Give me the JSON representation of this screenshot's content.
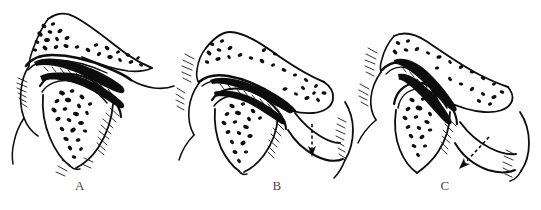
{
  "figure": {
    "type": "anatomical-line-drawing",
    "background_color": "#ffffff",
    "ink_color": "#0d0d0d",
    "label_color": "#4a4a4a",
    "panel_count": 3
  },
  "panels": [
    {
      "id": "A",
      "label": "A",
      "caption_position": "below-center",
      "stage": "closed",
      "has_arrow": false,
      "arrow_style": "",
      "structures": [
        "temporal bone",
        "articular eminence",
        "glenoid fossa",
        "articular disc",
        "mandibular condyle",
        "trabecular bone",
        "external auditory meatus",
        "lateral pterygoid attachment"
      ]
    },
    {
      "id": "B",
      "label": "B",
      "caption_position": "below-center",
      "stage": "partial-opening",
      "has_arrow": true,
      "arrow_style": "dashed-vertical-down",
      "arrow_meaning": "rotation of condyle / downward mandibular movement",
      "structures": [
        "temporal bone",
        "articular eminence",
        "glenoid fossa",
        "articular disc",
        "mandibular condyle",
        "mandibular ramus",
        "mandibular body",
        "trabecular bone",
        "lateral pterygoid attachment"
      ]
    },
    {
      "id": "C",
      "label": "C",
      "caption_position": "below-center",
      "stage": "full-translation",
      "has_arrow": true,
      "arrow_style": "dashed-diagonal-down-left",
      "arrow_meaning": "anterior translation of condyle / full opening",
      "structures": [
        "temporal bone",
        "articular eminence",
        "glenoid fossa",
        "articular disc",
        "translated mandibular condyle",
        "mandibular ramus",
        "mandibular body",
        "trabecular bone",
        "lateral pterygoid attachment"
      ]
    }
  ]
}
